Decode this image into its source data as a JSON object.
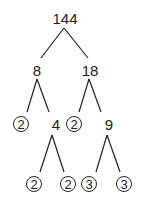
{
  "root": "144",
  "nodes": [
    {
      "id": "n144",
      "label": "144",
      "x": 65,
      "y": 18,
      "prime": false
    },
    {
      "id": "n8",
      "label": "8",
      "x": 37,
      "y": 70,
      "prime": false
    },
    {
      "id": "n18",
      "label": "18",
      "x": 90,
      "y": 70,
      "prime": false
    },
    {
      "id": "n2a",
      "label": "2",
      "x": 21,
      "y": 124,
      "prime": true
    },
    {
      "id": "n4",
      "label": "4",
      "x": 56,
      "y": 124,
      "prime": false
    },
    {
      "id": "n2b",
      "label": "2",
      "x": 74,
      "y": 124,
      "prime": true
    },
    {
      "id": "n9",
      "label": "9",
      "x": 109,
      "y": 124,
      "prime": false
    },
    {
      "id": "n2c",
      "label": "2",
      "x": 34,
      "y": 184,
      "prime": true
    },
    {
      "id": "n2d",
      "label": "2",
      "x": 68,
      "y": 184,
      "prime": true
    },
    {
      "id": "n3a",
      "label": "3",
      "x": 89,
      "y": 184,
      "prime": true
    },
    {
      "id": "n3b",
      "label": "3",
      "x": 124,
      "y": 184,
      "prime": true
    }
  ],
  "edges": [
    {
      "x1": 64,
      "y1": 28,
      "x2": 41,
      "y2": 58
    },
    {
      "x1": 64,
      "y1": 28,
      "x2": 88,
      "y2": 58
    },
    {
      "x1": 37,
      "y1": 79,
      "x2": 27,
      "y2": 112
    },
    {
      "x1": 37,
      "y1": 79,
      "x2": 49,
      "y2": 112
    },
    {
      "x1": 89,
      "y1": 79,
      "x2": 79,
      "y2": 112
    },
    {
      "x1": 89,
      "y1": 79,
      "x2": 101,
      "y2": 112
    },
    {
      "x1": 52,
      "y1": 135,
      "x2": 40,
      "y2": 172
    },
    {
      "x1": 52,
      "y1": 135,
      "x2": 64,
      "y2": 172
    },
    {
      "x1": 107,
      "y1": 135,
      "x2": 96,
      "y2": 172
    },
    {
      "x1": 107,
      "y1": 135,
      "x2": 120,
      "y2": 172
    }
  ],
  "prime_factors": [
    "2",
    "2",
    "2",
    "2",
    "3",
    "3"
  ]
}
